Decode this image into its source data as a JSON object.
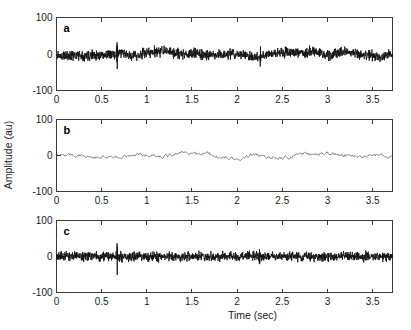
{
  "figure": {
    "width": 411,
    "height": 330,
    "background": "#ffffff",
    "xlabel": "Time (sec)",
    "ylabel": "Amplitude (au)"
  },
  "chart_data": [
    {
      "type": "line",
      "panel": "a",
      "panel_label": "a",
      "title": "",
      "xlabel": "",
      "ylabel": "Amplitude (au)",
      "xlim": [
        0,
        3.72
      ],
      "ylim": [
        -100,
        100
      ],
      "xticks": [
        0,
        0.5,
        1,
        1.5,
        2,
        2.5,
        3,
        3.5
      ],
      "xticklabels": [
        "0",
        "0.5",
        "1",
        "1.5",
        "2",
        "2.5",
        "3",
        "3.5"
      ],
      "yticks": [
        -100,
        0,
        100
      ],
      "yticklabels": [
        "-100",
        "0",
        "100"
      ],
      "grid": false,
      "legend": null,
      "line_color": "#111111",
      "line_width": 0.85,
      "description": "Raw composite signal: broadband noise riding on a slow drift, with a large transient spike near t=0.67 s and a smaller transient near t=2.25 s.",
      "seed": 11,
      "noise_amp": 11,
      "slow_amp": 7,
      "n_points": 1500,
      "spikes": [
        {
          "t": 0.672,
          "up": 57,
          "down": -46
        },
        {
          "t": 2.255,
          "up": 22,
          "down": -30
        }
      ]
    },
    {
      "type": "line",
      "panel": "b",
      "panel_label": "b",
      "title": "",
      "xlabel": "",
      "ylabel": "Amplitude (au)",
      "xlim": [
        0,
        3.72
      ],
      "ylim": [
        -100,
        100
      ],
      "xticks": [
        0,
        0.5,
        1,
        1.5,
        2,
        2.5,
        3,
        3.5
      ],
      "xticklabels": [
        "0",
        "0.5",
        "1",
        "1.5",
        "2",
        "2.5",
        "3",
        "3.5"
      ],
      "yticks": [
        -100,
        0,
        100
      ],
      "yticklabels": [
        "-100",
        "0",
        "100"
      ],
      "grid": false,
      "legend": null,
      "line_color": "#3c3c3c",
      "line_width": 0.6,
      "description": "Extracted low-frequency component: smooth thin trace with small ripples, largest excursions between t=1.5 s and t=2.6 s, no transient spikes.",
      "seed": 27,
      "noise_amp": 4.5,
      "slow_amp": 9,
      "n_points": 430,
      "spikes": []
    },
    {
      "type": "line",
      "panel": "c",
      "panel_label": "c",
      "title": "",
      "xlabel": "Time (sec)",
      "ylabel": "Amplitude (au)",
      "xlim": [
        0,
        3.72
      ],
      "ylim": [
        -100,
        100
      ],
      "xticks": [
        0,
        0.5,
        1,
        1.5,
        2,
        2.5,
        3,
        3.5
      ],
      "xticklabels": [
        "0",
        "0.5",
        "1",
        "1.5",
        "2",
        "2.5",
        "3",
        "3.5"
      ],
      "yticks": [
        -100,
        0,
        100
      ],
      "yticklabels": [
        "-100",
        "0",
        "100"
      ],
      "grid": false,
      "legend": null,
      "line_color": "#111111",
      "line_width": 0.85,
      "description": "High-frequency residual after removing the slow component: dense zero-mean noise with the transient spike preserved near t=0.67 s and a smaller one near t=2.25 s.",
      "seed": 43,
      "noise_amp": 10,
      "slow_amp": 0,
      "n_points": 1600,
      "spikes": [
        {
          "t": 0.672,
          "up": 58,
          "down": -48
        },
        {
          "t": 2.248,
          "up": 20,
          "down": -28
        }
      ]
    }
  ],
  "axes_geometry": {
    "plot_left": 56.5,
    "plot_right": 392.5,
    "panels": [
      {
        "top": 17.5,
        "bottom": 90.5
      },
      {
        "top": 119.5,
        "bottom": 191.5
      },
      {
        "top": 220.5,
        "bottom": 292.5
      }
    ]
  }
}
